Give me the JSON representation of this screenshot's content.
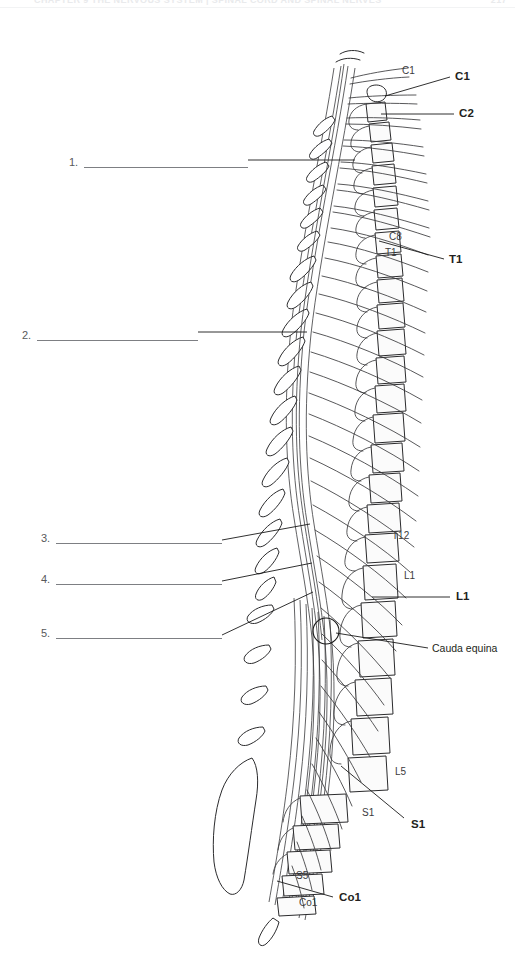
{
  "page": {
    "width": 515,
    "height": 959,
    "background": "#ffffff",
    "header_text": "CHAPTER 9  THE NERVOUS SYSTEM  |  SPINAL CORD AND SPINAL NERVES",
    "header_page_number": "217"
  },
  "figure": {
    "ink_color": "#231f20",
    "line_color": "#7d7f83"
  },
  "answer_blanks": [
    {
      "number": "1.",
      "x": 69,
      "y": 155,
      "rule_left": 84,
      "rule_width": 164
    },
    {
      "number": "2.",
      "x": 22,
      "y": 328,
      "rule_left": 37,
      "rule_width": 161
    },
    {
      "number": "3.",
      "x": 41,
      "y": 531,
      "rule_left": 56,
      "rule_width": 166
    },
    {
      "number": "4.",
      "x": 41,
      "y": 572,
      "rule_left": 56,
      "rule_width": 166
    },
    {
      "number": "5.",
      "x": 41,
      "y": 626,
      "rule_left": 56,
      "rule_width": 166
    }
  ],
  "leader_lines": [
    {
      "name": "blank-1-leader",
      "x1": 248,
      "y1": 160,
      "x2": 355,
      "y2": 160
    },
    {
      "name": "blank-2-leader",
      "x1": 198,
      "y1": 332,
      "x2": 307,
      "y2": 332
    },
    {
      "name": "blank-3-leader",
      "x1": 222,
      "y1": 540,
      "x2": 310,
      "y2": 524
    },
    {
      "name": "blank-4-leader",
      "x1": 222,
      "y1": 581,
      "x2": 312,
      "y2": 563
    },
    {
      "name": "blank-5-leader",
      "x1": 222,
      "y1": 635,
      "x2": 313,
      "y2": 592
    },
    {
      "name": "c1-leader",
      "x1": 450,
      "y1": 77,
      "x2": 385,
      "y2": 96
    },
    {
      "name": "c2-leader",
      "x1": 454,
      "y1": 114,
      "x2": 381,
      "y2": 114
    },
    {
      "name": "t1-leader",
      "x1": 444,
      "y1": 259,
      "x2": 379,
      "y2": 241
    },
    {
      "name": "l1-leader",
      "x1": 450,
      "y1": 597,
      "x2": 372,
      "y2": 597
    },
    {
      "name": "cauda-leader",
      "x1": 428,
      "y1": 648,
      "x2": 336,
      "y2": 633
    },
    {
      "name": "s1-leader",
      "x1": 404,
      "y1": 818,
      "x2": 341,
      "y2": 766
    },
    {
      "name": "co1-leader",
      "x1": 333,
      "y1": 897,
      "x2": 277,
      "y2": 881
    }
  ],
  "segment_labels": [
    {
      "id": "c1-light",
      "text": "C1",
      "x": 402,
      "y": 66,
      "weight": "light"
    },
    {
      "id": "c1-bold",
      "text": "C1",
      "x": 455,
      "y": 71,
      "weight": "bold"
    },
    {
      "id": "c2-bold",
      "text": "C2",
      "x": 459,
      "y": 108,
      "weight": "bold"
    },
    {
      "id": "c8-light",
      "text": "C8",
      "x": 389,
      "y": 232,
      "weight": "light"
    },
    {
      "id": "t1-light",
      "text": "T1",
      "x": 385,
      "y": 248,
      "weight": "light"
    },
    {
      "id": "t1-bold",
      "text": "T1",
      "x": 449,
      "y": 254,
      "weight": "bold"
    },
    {
      "id": "t12-light",
      "text": "T12",
      "x": 392,
      "y": 531,
      "weight": "light"
    },
    {
      "id": "l1-light",
      "text": "L1",
      "x": 404,
      "y": 571,
      "weight": "light"
    },
    {
      "id": "l1-bold",
      "text": "L1",
      "x": 456,
      "y": 591,
      "weight": "bold"
    },
    {
      "id": "cauda",
      "text": "Cauda equina",
      "x": 432,
      "y": 643,
      "weight": "plain"
    },
    {
      "id": "l5-light",
      "text": "L5",
      "x": 395,
      "y": 767,
      "weight": "light"
    },
    {
      "id": "s1-light",
      "text": "S1",
      "x": 362,
      "y": 808,
      "weight": "light"
    },
    {
      "id": "s1-bold",
      "text": "S1",
      "x": 411,
      "y": 819,
      "weight": "bold"
    },
    {
      "id": "s5-light",
      "text": "S5",
      "x": 296,
      "y": 871,
      "weight": "light"
    },
    {
      "id": "co1-light",
      "text": "Co1",
      "x": 299,
      "y": 898,
      "weight": "light"
    },
    {
      "id": "co1-bold",
      "text": "Co1",
      "x": 339,
      "y": 892,
      "weight": "bold"
    }
  ],
  "cauda_equina_marker": {
    "cx": 326,
    "cy": 631,
    "r": 13
  }
}
